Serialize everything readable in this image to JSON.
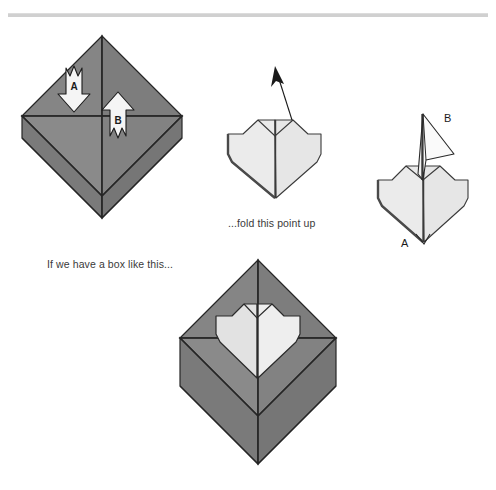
{
  "page": {
    "width": 496,
    "height": 490,
    "background": "#ffffff",
    "rule_color": "#d0d0d0"
  },
  "palette": {
    "paper_gray": "#808080",
    "paper_gray_dark": "#6e6e6e",
    "paper_gray_light": "#8a8a8a",
    "heart_light": "#ebebeb",
    "heart_shade": "#dcdcdc",
    "line": "#262626",
    "text": "#3a3a3a",
    "arrow_fill": "#f5f5f5"
  },
  "figures": [
    {
      "id": "box-start",
      "name": "origami-box-diamond",
      "caption": "If we have a box like this...",
      "arrows": [
        {
          "id": "A",
          "label": "A",
          "direction": "down"
        },
        {
          "id": "B",
          "label": "B",
          "direction": "up"
        }
      ]
    },
    {
      "id": "heart-flat",
      "name": "origami-heart-flat",
      "caption": "...fold this point up",
      "arrows": [
        {
          "id": "fold-up",
          "label": "",
          "direction": "up-left"
        }
      ]
    },
    {
      "id": "heart-folded",
      "name": "origami-heart-point-folded",
      "caption": "",
      "labels": [
        {
          "id": "B",
          "label": "B"
        },
        {
          "id": "A",
          "label": "A"
        }
      ]
    },
    {
      "id": "box-heart",
      "name": "origami-box-with-heart",
      "caption": ""
    }
  ],
  "captions": {
    "box_start": "If we have a box like this...",
    "fold_point": "...fold this point up"
  },
  "labels": {
    "arrow_a": "A",
    "arrow_b": "B",
    "point_b": "B",
    "point_a": "A"
  }
}
